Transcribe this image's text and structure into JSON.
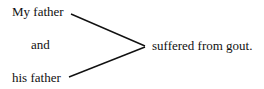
{
  "diagram": {
    "subjects": [
      "My father",
      "and",
      "his father"
    ],
    "predicate": "suffered from gout.",
    "line_color": "#111111"
  }
}
